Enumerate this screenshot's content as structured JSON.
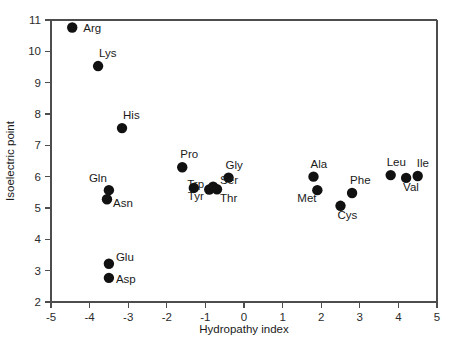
{
  "chart_data": {
    "type": "scatter",
    "title": "",
    "xlabel": "Hydropathy index",
    "ylabel": "Isoelectric point",
    "xlim": [
      -5,
      5
    ],
    "ylim": [
      2,
      11
    ],
    "grid": false,
    "legend": "none",
    "xticks": [
      -5,
      -4,
      -3,
      -2,
      -1,
      0,
      1,
      2,
      3,
      4,
      5
    ],
    "xtick_labels": [
      "-5",
      "-4",
      "-3",
      "-2",
      "-1",
      "0",
      "1",
      "2",
      "3",
      "4",
      "5"
    ],
    "yticks": [
      2,
      3,
      4,
      5,
      6,
      7,
      8,
      9,
      10,
      11
    ],
    "ytick_labels": [
      "2",
      "3",
      "4",
      "5",
      "6",
      "7",
      "8",
      "9",
      "10",
      "11"
    ],
    "marker": "filled-circle",
    "marker_color": "#111111",
    "marker_size": 5.2,
    "points": [
      {
        "label": "Arg",
        "x": -4.45,
        "y": 10.76,
        "label_dx": 11,
        "label_dy": 4
      },
      {
        "label": "Lys",
        "x": -3.78,
        "y": 9.53,
        "label_dx": 1,
        "label_dy": -9
      },
      {
        "label": "His",
        "x": -3.16,
        "y": 7.55,
        "label_dx": 1,
        "label_dy": -9
      },
      {
        "label": "Gln",
        "x": -3.5,
        "y": 5.57,
        "label_dx": -20,
        "label_dy": -8
      },
      {
        "label": "Asn",
        "x": -3.55,
        "y": 5.28,
        "label_dx": 6,
        "label_dy": 8
      },
      {
        "label": "Glu",
        "x": -3.5,
        "y": 3.22,
        "label_dx": 7,
        "label_dy": -3
      },
      {
        "label": "Asp",
        "x": -3.5,
        "y": 2.77,
        "label_dx": 7,
        "label_dy": 5
      },
      {
        "label": "Pro",
        "x": -1.6,
        "y": 6.3,
        "label_dx": -2,
        "label_dy": -9
      },
      {
        "label": "Gly",
        "x": -0.4,
        "y": 5.97,
        "label_dx": -3,
        "label_dy": -9
      },
      {
        "label": "Trp",
        "x": -0.9,
        "y": 5.59,
        "label_dx": -22,
        "label_dy": -2
      },
      {
        "label": "Ser",
        "x": -0.8,
        "y": 5.68,
        "label_dx": 7,
        "label_dy": -3
      },
      {
        "label": "Tyr",
        "x": -1.3,
        "y": 5.64,
        "label_dx": -6,
        "label_dy": 12
      },
      {
        "label": "Thr",
        "x": -0.7,
        "y": 5.6,
        "label_dx": 3,
        "label_dy": 13
      },
      {
        "label": "Ala",
        "x": 1.8,
        "y": 6.0,
        "label_dx": -3,
        "label_dy": -9
      },
      {
        "label": "Met",
        "x": 1.9,
        "y": 5.57,
        "label_dx": -20,
        "label_dy": 12
      },
      {
        "label": "Phe",
        "x": 2.8,
        "y": 5.48,
        "label_dx": -2,
        "label_dy": -9
      },
      {
        "label": "Cys",
        "x": 2.5,
        "y": 5.07,
        "label_dx": -3,
        "label_dy": 13
      },
      {
        "label": "Leu",
        "x": 3.8,
        "y": 6.05,
        "label_dx": -4,
        "label_dy": -9
      },
      {
        "label": "Val",
        "x": 4.2,
        "y": 5.96,
        "label_dx": -3,
        "label_dy": 13
      },
      {
        "label": "Ile",
        "x": 4.5,
        "y": 6.02,
        "label_dx": -1,
        "label_dy": -9
      }
    ]
  },
  "geometry": {
    "plot_left": 51,
    "plot_right": 437,
    "plot_top": 20,
    "plot_bottom": 302
  }
}
